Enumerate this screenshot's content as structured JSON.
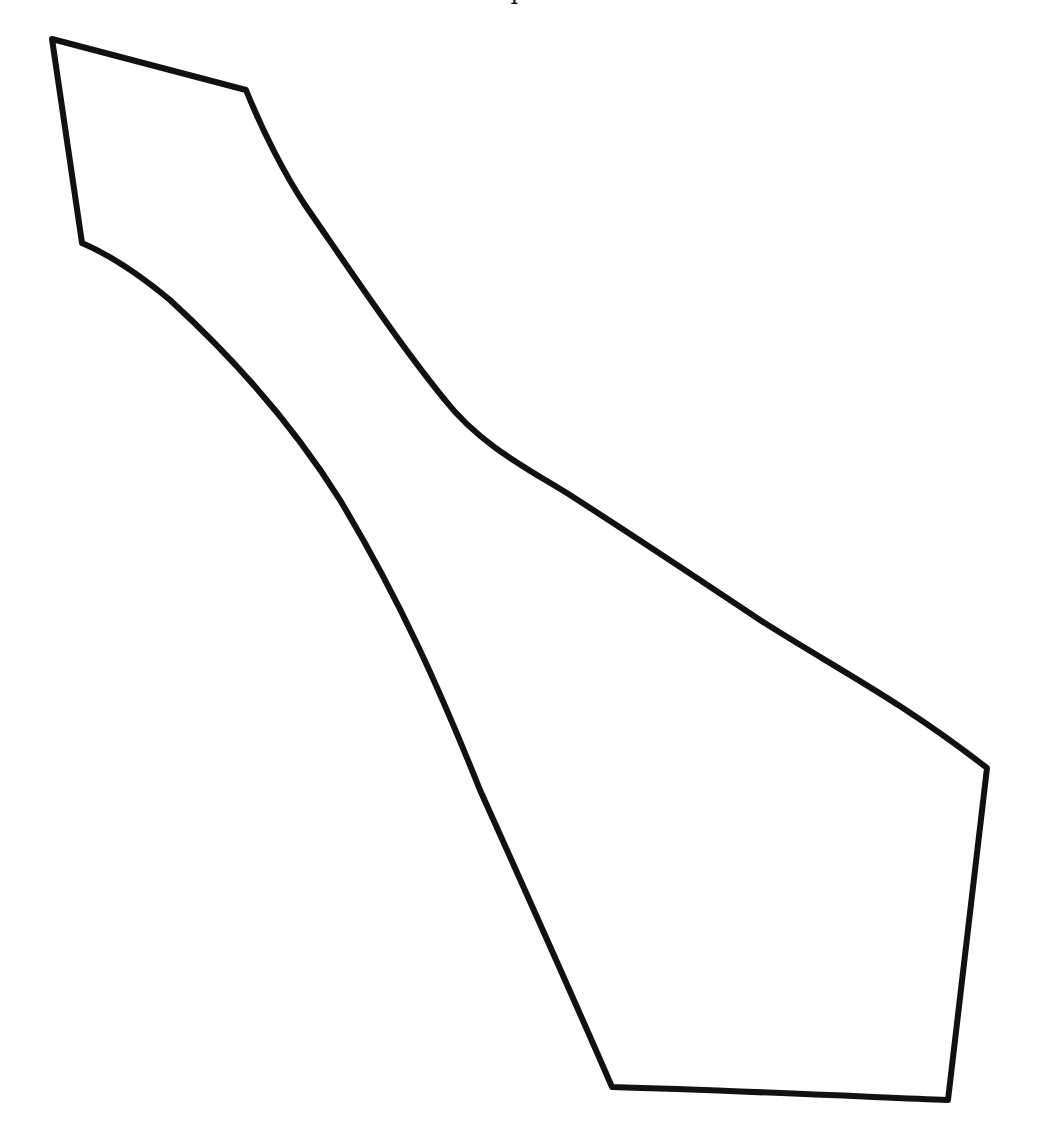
{
  "figure": {
    "stroke_color": "#111111",
    "background_color": "#ffffff",
    "stroke_width": 6,
    "top_cropped_glyph": "I",
    "path": "M52,39 L246,90 C262,130 285,175 305,205 C350,270 400,345 445,400 C480,445 530,470 570,495 C640,540 700,580 760,620 C830,665 900,700 987,768 L948,1100 C850,1096 720,1090 612,1087 C570,990 525,890 480,790 C440,690 400,600 340,500 C290,420 230,355 170,300 C140,275 110,255 82,243 Z"
  }
}
